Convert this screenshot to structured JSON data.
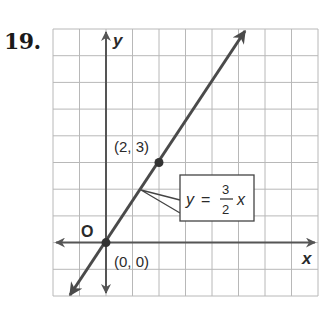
{
  "problem_number": "19.",
  "graph": {
    "x_axis_label": "x",
    "y_axis_label": "y",
    "origin_label": "O",
    "x_range": [
      -2,
      8
    ],
    "y_range": [
      -2,
      8
    ],
    "grid_step": 1
  },
  "line": {
    "equation_lhs": "y",
    "equation_eq": "=",
    "equation_num": "3",
    "equation_den": "2",
    "equation_var": "x",
    "slope": 1.5,
    "intercept": 0
  },
  "points": [
    {
      "label": "(2, 3)",
      "x": 2,
      "y": 3
    },
    {
      "label": "(0, 0)",
      "x": 0,
      "y": 0
    }
  ],
  "colors": {
    "line": "#4a4a4a",
    "grid": "#b8b8b8",
    "axis": "#555555"
  }
}
